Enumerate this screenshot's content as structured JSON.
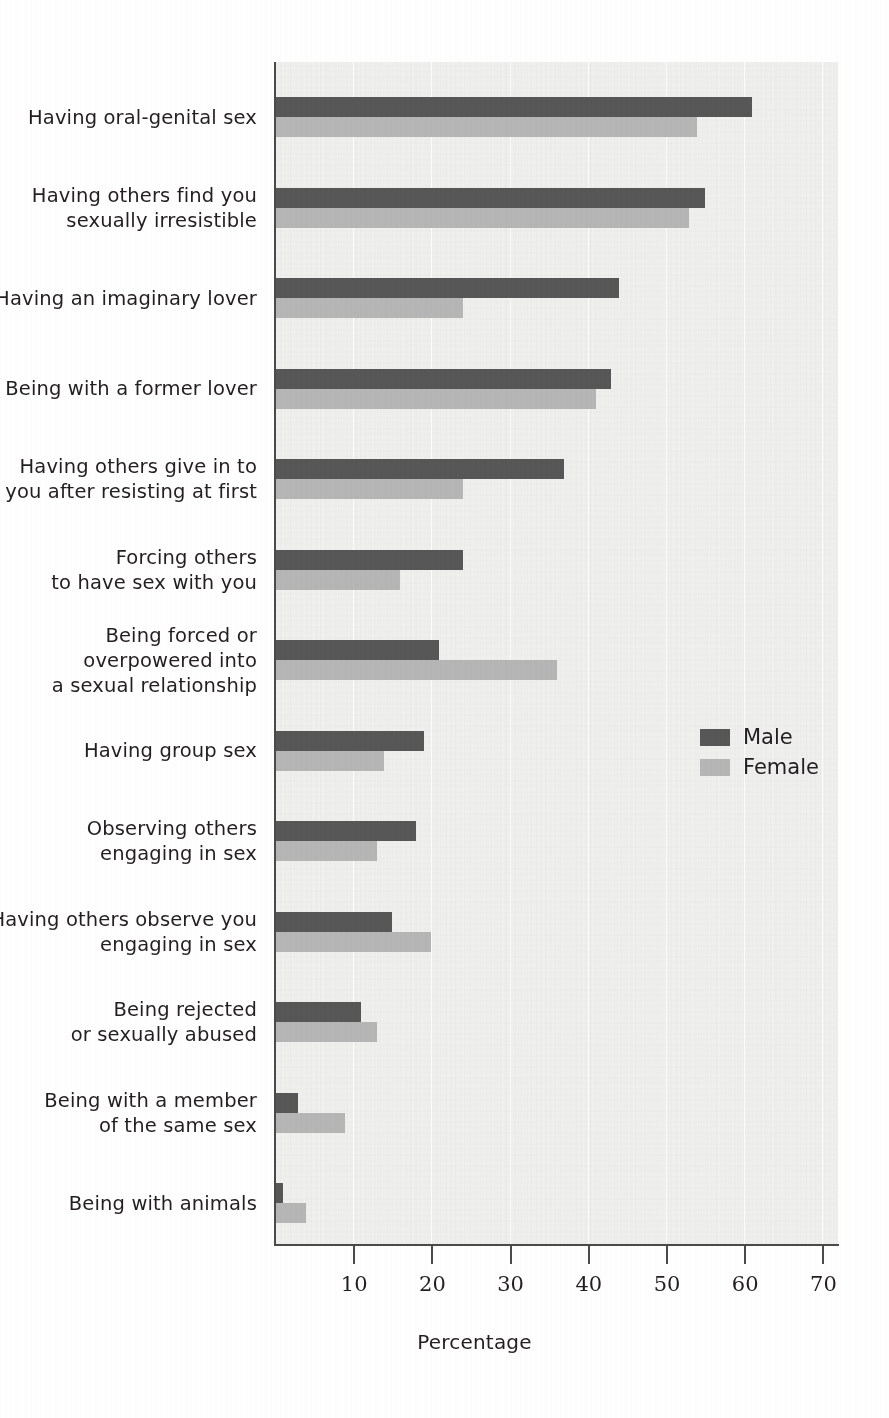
{
  "chart_data": {
    "type": "bar",
    "orientation": "horizontal",
    "title": "",
    "xlabel": "Percentage",
    "ylabel": "",
    "xlim": [
      0,
      73
    ],
    "xticks": [
      10,
      20,
      30,
      40,
      50,
      60,
      70
    ],
    "grid": true,
    "legend_position": "right-middle",
    "categories": [
      "Having oral-genital sex",
      "Having others find you sexually irresistible",
      "Having an imaginary lover",
      "Being with a former lover",
      "Having others give in to you after resisting at first",
      "Forcing others to have sex with you",
      "Being forced or overpowered into a sexual relationship",
      "Having group sex",
      "Observing others engaging in sex",
      "Having others observe you engaging in sex",
      "Being rejected or sexually abused",
      "Being with a member of the same sex",
      "Being with animals"
    ],
    "series": [
      {
        "name": "Male",
        "color": "#575757",
        "values": [
          61,
          55,
          44,
          43,
          37,
          24,
          21,
          19,
          18,
          15,
          11,
          3,
          1
        ]
      },
      {
        "name": "Female",
        "color": "#b6b6b6",
        "values": [
          54,
          53,
          24,
          41,
          24,
          16,
          36,
          14,
          13,
          20,
          13,
          9,
          4
        ]
      }
    ]
  },
  "categories_display": [
    {
      "lines": [
        "Having oral-genital sex"
      ]
    },
    {
      "lines": [
        "Having others find you",
        "sexually irresistible"
      ]
    },
    {
      "lines": [
        "Having an imaginary lover"
      ]
    },
    {
      "lines": [
        "Being with a former lover"
      ]
    },
    {
      "lines": [
        "Having others give in to",
        "you after resisting at first"
      ]
    },
    {
      "lines": [
        "Forcing others",
        "to have sex with you"
      ]
    },
    {
      "lines": [
        "Being forced or",
        "overpowered into",
        "a sexual relationship"
      ]
    },
    {
      "lines": [
        "Having group sex"
      ]
    },
    {
      "lines": [
        "Observing others",
        "engaging in sex"
      ]
    },
    {
      "lines": [
        "Having others observe you",
        "engaging in sex"
      ]
    },
    {
      "lines": [
        "Being rejected",
        "or sexually abused"
      ]
    },
    {
      "lines": [
        "Being with a member",
        "of the same sex"
      ]
    },
    {
      "lines": [
        "Being with animals"
      ]
    }
  ],
  "axis": {
    "x_title": "Percentage",
    "tick_labels": [
      "10",
      "20",
      "30",
      "40",
      "50",
      "60",
      "70"
    ]
  },
  "legend": {
    "items": [
      {
        "label": "Male",
        "color": "#575757"
      },
      {
        "label": "Female",
        "color": "#b6b6b6"
      }
    ]
  },
  "colors": {
    "male": "#575757",
    "female": "#b6b6b6",
    "plot_background": "#f1f1f0",
    "axis": "#4a4a4a",
    "text": "#231f20"
  }
}
